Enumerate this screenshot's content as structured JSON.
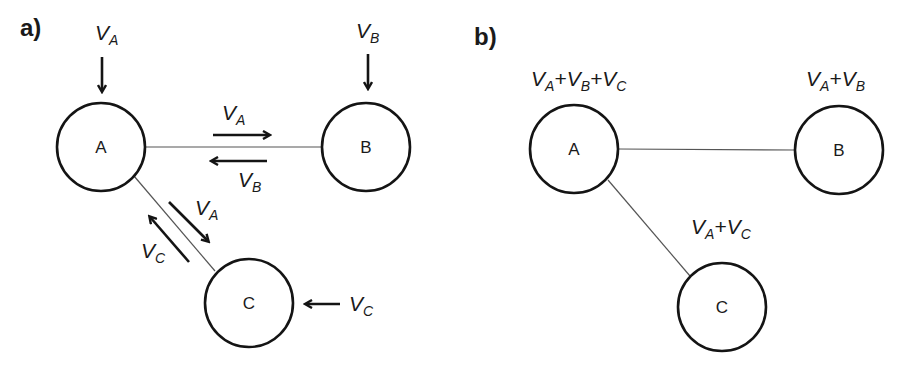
{
  "panels": [
    {
      "label": "a)",
      "nodes": [
        {
          "id": "A",
          "label": "A",
          "cx": 101,
          "cy": 147,
          "r": 44
        },
        {
          "id": "B",
          "label": "B",
          "cx": 366,
          "cy": 147,
          "r": 44
        },
        {
          "id": "C",
          "label": "C",
          "cx": 249,
          "cy": 303,
          "r": 44
        }
      ],
      "edges": [
        [
          "A",
          "B"
        ],
        [
          "A",
          "C"
        ]
      ],
      "labels": {
        "input_A": {
          "v": "V",
          "s": "A"
        },
        "input_B": {
          "v": "V",
          "s": "B"
        },
        "input_C": {
          "v": "V",
          "s": "C"
        },
        "ab_forward": {
          "v": "V",
          "s": "A"
        },
        "ab_backward": {
          "v": "V",
          "s": "B"
        },
        "ac_forward": {
          "v": "V",
          "s": "A"
        },
        "ac_backward": {
          "v": "V",
          "s": "C"
        }
      }
    },
    {
      "label": "b)",
      "nodes": [
        {
          "id": "A",
          "label": "A",
          "cx": 574,
          "cy": 149,
          "r": 44
        },
        {
          "id": "B",
          "label": "B",
          "cx": 839,
          "cy": 150,
          "r": 44
        },
        {
          "id": "C",
          "label": "C",
          "cx": 722,
          "cy": 307,
          "r": 44
        }
      ],
      "edges": [
        [
          "A",
          "B"
        ],
        [
          "A",
          "C"
        ]
      ],
      "sums": {
        "A": "VA+VB+VC",
        "B": "VA+VB",
        "C": "VA+VC"
      }
    }
  ],
  "v": "V",
  "plus": "+",
  "sub_A": "A",
  "sub_B": "B",
  "sub_C": "C"
}
